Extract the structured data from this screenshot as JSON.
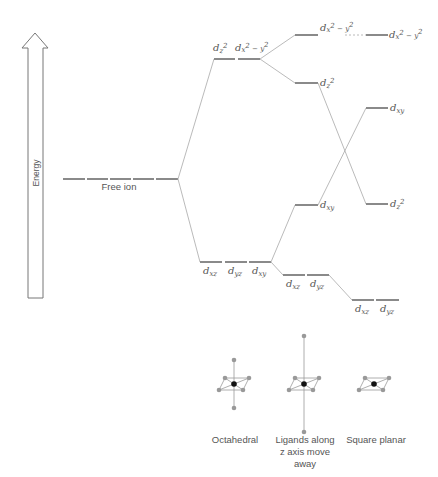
{
  "axis": {
    "label": "Energy"
  },
  "free_ion": {
    "label": "Free ion"
  },
  "octahedral": {
    "eg": [
      {
        "base": "d",
        "sub": "z",
        "sup": "2"
      },
      {
        "base": "d",
        "sub": "x",
        "sup": "2 − y",
        "sup2": "2"
      }
    ],
    "eg_labels": [
      "dz²",
      "dx²−y²"
    ],
    "t2g_labels": [
      "dxz",
      "dyz",
      "dxy"
    ]
  },
  "tetragonal": {
    "labels": {
      "x2y2": "dx²−y²",
      "z2": "dz²",
      "xy": "dxy",
      "xz": "dxz",
      "yz": "dyz"
    }
  },
  "square_planar": {
    "labels": {
      "x2y2": "dx²−y²",
      "xy": "dxy",
      "z2": "dz²",
      "xz": "dxz",
      "yz": "dyz"
    }
  },
  "geometries": [
    {
      "caption": [
        "Octahedral"
      ]
    },
    {
      "caption": [
        "Ligands along",
        "z axis move",
        "away"
      ]
    },
    {
      "caption": [
        "Square planar"
      ]
    }
  ],
  "colors": {
    "level": "#8a8a8a",
    "connector": "#a8a8a8",
    "text": "#555555"
  }
}
